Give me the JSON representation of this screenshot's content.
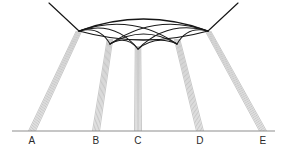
{
  "figure": {
    "type": "geometric-ray-diagram",
    "title": "",
    "background_color": "#ffffff",
    "width": 285,
    "height": 150,
    "colors": {
      "baseline": "#8d8d8d",
      "ray_bundle": "#9a9a9a",
      "lens_outline": "#161616",
      "inner_arc": "#1b1b1b",
      "label": "#2a2a2a"
    }
  },
  "baseline": {
    "label": "baseline",
    "x1": 12,
    "x2": 275,
    "y": 131
  },
  "labels": [
    {
      "id": "A",
      "text": "A",
      "x": 32,
      "y": 144
    },
    {
      "id": "B",
      "text": "B",
      "x": 96,
      "y": 144
    },
    {
      "id": "C",
      "text": "C",
      "x": 138,
      "y": 144
    },
    {
      "id": "D",
      "text": "D",
      "x": 200,
      "y": 144
    },
    {
      "id": "E",
      "text": "E",
      "x": 263,
      "y": 144
    }
  ],
  "ray_bundles": [
    {
      "id": "bundle-A",
      "source_label": "A",
      "base_x": 32,
      "base_spread": 7,
      "apex_x": 79,
      "apex_y": 31,
      "ray_count": 6
    },
    {
      "id": "bundle-B",
      "source_label": "B",
      "base_x": 96,
      "base_spread": 7,
      "apex_x": 110,
      "apex_y": 39,
      "ray_count": 6
    },
    {
      "id": "bundle-C",
      "source_label": "C",
      "base_x": 138,
      "base_spread": 7,
      "apex_x": 138,
      "apex_y": 46,
      "ray_count": 6
    },
    {
      "id": "bundle-D",
      "source_label": "D",
      "base_x": 200,
      "base_spread": 7,
      "apex_x": 177,
      "apex_y": 39,
      "ray_count": 6
    },
    {
      "id": "bundle-E",
      "source_label": "E",
      "base_x": 263,
      "base_spread": 7,
      "apex_x": 208,
      "apex_y": 31,
      "ray_count": 6
    }
  ],
  "lens": {
    "id": "caustic-lens",
    "left_vertex": {
      "x": 79,
      "y": 31
    },
    "right_vertex": {
      "x": 208,
      "y": 31
    },
    "upper_sag": -24,
    "lower_sag": 18,
    "description": "lens-shaped caustic envelope"
  },
  "tails": [
    {
      "id": "tail-left",
      "from_x": 49,
      "from_y": 3,
      "to_x": 79,
      "to_y": 31
    },
    {
      "id": "tail-right",
      "from_x": 238,
      "from_y": 3,
      "to_x": 208,
      "to_y": 31
    }
  ],
  "inner_arcs": {
    "description": "nested arcs spanning cusp nodes along the lower lens boundary",
    "nodes": [
      {
        "id": "n0",
        "x": 79,
        "y": 31
      },
      {
        "id": "n1",
        "x": 110,
        "y": 44
      },
      {
        "id": "n2",
        "x": 138,
        "y": 49
      },
      {
        "id": "n3",
        "x": 177,
        "y": 44
      },
      {
        "id": "n4",
        "x": 208,
        "y": 31
      }
    ],
    "spans": [
      {
        "from": "n0",
        "to": "n1",
        "sag": -13
      },
      {
        "from": "n1",
        "to": "n2",
        "sag": -12
      },
      {
        "from": "n2",
        "to": "n3",
        "sag": -12
      },
      {
        "from": "n3",
        "to": "n4",
        "sag": -13
      },
      {
        "from": "n0",
        "to": "n2",
        "sag": -21
      },
      {
        "from": "n1",
        "to": "n3",
        "sag": -20
      },
      {
        "from": "n2",
        "to": "n4",
        "sag": -21
      },
      {
        "from": "n0",
        "to": "n3",
        "sag": -25
      },
      {
        "from": "n1",
        "to": "n4",
        "sag": -25
      }
    ]
  }
}
